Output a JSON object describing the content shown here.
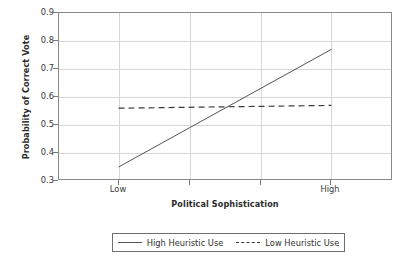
{
  "chart_data": {
    "type": "line",
    "title": "",
    "xlabel": "Political Sophistication",
    "ylabel": "Probability of Correct Vote",
    "categories": [
      "Low",
      "High"
    ],
    "x": [
      0,
      1
    ],
    "xlim": [
      -0.28,
      1.29
    ],
    "ylim": [
      0.3,
      0.9
    ],
    "yticks": [
      "0.3",
      "0.4",
      "0.5",
      "0.6",
      "0.7",
      "0.8",
      "0.9"
    ],
    "ytick_values": [
      0.3,
      0.4,
      0.5,
      0.6,
      0.7,
      0.8,
      0.9
    ],
    "xticks": [
      "Low",
      "High"
    ],
    "grid": true,
    "legend_position": "bottom",
    "series": [
      {
        "name": "High Heuristic Use",
        "style": "solid",
        "color": "#555555",
        "values": [
          0.35,
          0.77
        ]
      },
      {
        "name": "Low Heuristic Use",
        "style": "dashed",
        "color": "#3b3b3b",
        "values": [
          0.56,
          0.57
        ]
      }
    ]
  },
  "axes": {
    "y_title": "Probability of Correct Vote",
    "x_title": "Political Sophistication",
    "y_tick_labels": [
      "0.9",
      "0.8",
      "0.7",
      "0.6",
      "0.5",
      "0.4",
      "0.3"
    ],
    "x_tick_labels": [
      "Low",
      "High"
    ]
  },
  "legend": {
    "entries": [
      {
        "label": "High Heuristic Use",
        "style": "solid"
      },
      {
        "label": "Low Heuristic Use",
        "style": "dashed"
      }
    ]
  },
  "colors": {
    "frame": "#8a8a8a",
    "grid": "#d6d6d6",
    "series_solid": "#555555",
    "series_dashed": "#3b3b3b",
    "text": "#2f2f2f",
    "background": "#ffffff"
  }
}
